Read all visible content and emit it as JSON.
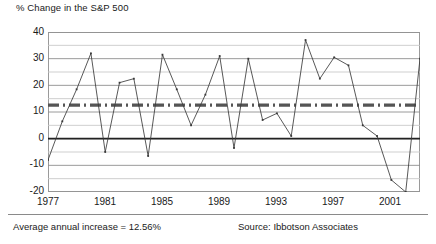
{
  "chart_data": {
    "type": "line",
    "title": "% Change in the S&P 500",
    "xlabel": "",
    "ylabel": "",
    "grid": true,
    "legend": "none",
    "xlim": [
      1977,
      2003
    ],
    "ylim": [
      -20,
      40
    ],
    "y_ticks": [
      "40",
      "30",
      "20",
      "10",
      "0",
      "-10",
      "-20"
    ],
    "y_tick_values": [
      40,
      30,
      20,
      10,
      0,
      -10,
      -20
    ],
    "y_gridline_values": [
      40,
      35,
      30,
      25,
      20,
      15,
      10,
      5,
      0,
      -5,
      -10,
      -15,
      -20
    ],
    "x_ticks": [
      "1977",
      "1981",
      "1985",
      "1989",
      "1993",
      "1997",
      "2001"
    ],
    "x_tick_values": [
      1977,
      1981,
      1985,
      1989,
      1993,
      1997,
      2001
    ],
    "x": [
      1977,
      1978,
      1979,
      1980,
      1981,
      1982,
      1983,
      1984,
      1985,
      1986,
      1987,
      1988,
      1989,
      1990,
      1991,
      1992,
      1993,
      1994,
      1995,
      1996,
      1997,
      1998,
      1999,
      2000,
      2001,
      2002,
      2003
    ],
    "series": [
      {
        "name": "% Change in the S&P 500",
        "values": [
          -8,
          6.5,
          18.5,
          32,
          -5,
          21,
          22.5,
          -6.5,
          31.5,
          18.5,
          5,
          16.5,
          31,
          -3.5,
          30,
          7,
          9.5,
          1,
          37,
          22.5,
          30.5,
          27.5,
          5,
          1,
          -15.5,
          -20,
          30
        ],
        "color": "#3a3a3a",
        "markers": true
      }
    ],
    "reference_lines": [
      {
        "name": "zero-line",
        "value": 0,
        "style": "solid",
        "color": "#222222",
        "width": 1.6
      },
      {
        "name": "average-line",
        "value": 12.56,
        "style": "dash-dot",
        "color": "#555555",
        "width": 3.4
      }
    ]
  },
  "footer": {
    "average_note": "Average annual increase = 12.56%",
    "source_note": "Source: Ibbotson Associates"
  }
}
